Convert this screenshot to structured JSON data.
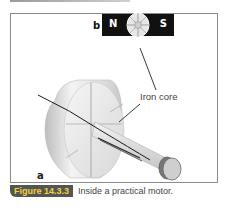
{
  "figure": {
    "labels": {
      "b": "b",
      "a": "a",
      "north": "N",
      "south": "S",
      "iron_core": "Iron core"
    },
    "caption": {
      "number": "Figure 14.3.3",
      "text": "Inside a practical motor."
    },
    "colors": {
      "badge_bg": "#555555",
      "badge_text": "#f2d33a",
      "magnet": "#111111"
    },
    "icons": [
      "bar-magnet-icon",
      "motor-rotor-illustration"
    ]
  }
}
